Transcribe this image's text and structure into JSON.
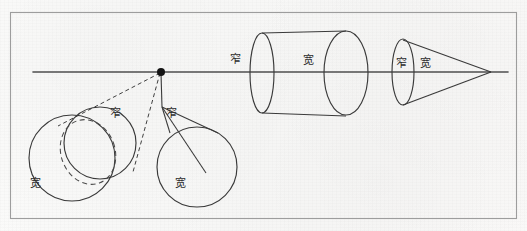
{
  "figure": {
    "page_size": {
      "width": 527,
      "height": 231
    },
    "colors": {
      "paper": "#fafafa",
      "ink": "#3a3a3a",
      "border": "#9a9a9a",
      "horizon": "#555555",
      "vanishing_point": "#111111",
      "label_text": "#2b2b2b"
    },
    "border_frame": {
      "x": 10,
      "y": 12,
      "width": 507,
      "height": 207
    },
    "horizon_line": {
      "x1": 33,
      "y1": 72,
      "x2": 508,
      "y2": 72
    },
    "vanishing_point": {
      "x": 161,
      "y": 72,
      "radius": 4
    }
  },
  "labels": {
    "narrow": "窄",
    "wide": "宽",
    "items": [
      {
        "id": "label-cylinder-far-narrow",
        "text": "窄",
        "x": 230,
        "y": 55,
        "belongs_to": "cylinder-perspective"
      },
      {
        "id": "label-cylinder-near-wide",
        "text": "宽",
        "x": 303,
        "y": 56,
        "belongs_to": "cylinder-perspective"
      },
      {
        "id": "label-cone-base-narrow",
        "text": "窄",
        "x": 396,
        "y": 59,
        "belongs_to": "cone-perspective"
      },
      {
        "id": "label-cone-side-wide",
        "text": "宽",
        "x": 420,
        "y": 59,
        "belongs_to": "cone-perspective"
      },
      {
        "id": "label-left-circles-narrow",
        "text": "窄",
        "x": 110,
        "y": 110,
        "belongs_to": "left-circle-pair"
      },
      {
        "id": "label-left-circles-wide",
        "text": "宽",
        "x": 30,
        "y": 180,
        "belongs_to": "left-circle-pair"
      },
      {
        "id": "label-right-circle-narrow",
        "text": "窄",
        "x": 167,
        "y": 110,
        "belongs_to": "right-cone-circle"
      },
      {
        "id": "label-right-circle-wide",
        "text": "宽",
        "x": 175,
        "y": 180,
        "belongs_to": "right-cone-circle"
      }
    ]
  },
  "shapes": {
    "left_circle_pair": {
      "name": "left-circle-pair",
      "solid_large_circle": {
        "cx": 72,
        "cy": 158,
        "r": 43
      },
      "solid_small_circle": {
        "cx": 100,
        "cy": 143,
        "r": 36
      },
      "dashed_ellipse": {
        "cx": 88,
        "cy": 153,
        "rx": 27,
        "ry": 33,
        "rotation": -22
      },
      "tangent_lines": [
        {
          "x1": 161,
          "y1": 72,
          "x2": 63,
          "y2": 122
        },
        {
          "x1": 161,
          "y1": 72,
          "x2": 132,
          "y2": 170
        }
      ],
      "tangent_style": "dashed"
    },
    "right_cone_circle": {
      "name": "right-cone-circle",
      "circle": {
        "cx": 197,
        "cy": 167,
        "r": 40
      },
      "apex": {
        "x": 161,
        "y": 106
      },
      "side_lines": [
        {
          "x1": 161,
          "y1": 106,
          "x2": 214,
          "y2": 129
        },
        {
          "x1": 161,
          "y1": 106,
          "x2": 168,
          "y2": 132
        }
      ],
      "axis_line": {
        "x1": 161,
        "y1": 106,
        "x2": 205,
        "y2": 172
      },
      "guide_from_vp": {
        "x1": 161,
        "y1": 72,
        "x2": 161,
        "y2": 106
      }
    },
    "cylinder": {
      "name": "cylinder-perspective",
      "far_ellipse": {
        "cx": 262,
        "cy": 73,
        "rx": 12,
        "ry": 40
      },
      "near_ellipse": {
        "cx": 345,
        "cy": 73,
        "rx": 22,
        "ry": 42
      },
      "top_line": {
        "x1": 262,
        "y1": 33,
        "x2": 345,
        "y2": 31
      },
      "bottom_line": {
        "x1": 262,
        "y1": 113,
        "x2": 345,
        "y2": 115
      }
    },
    "cone": {
      "name": "cone-perspective",
      "base_ellipse": {
        "cx": 403,
        "cy": 72,
        "rx": 11,
        "ry": 33
      },
      "apex": {
        "x": 491,
        "y": 72
      },
      "side_lines": [
        {
          "x1": 403,
          "y1": 39,
          "x2": 491,
          "y2": 72
        },
        {
          "x1": 403,
          "y1": 105,
          "x2": 491,
          "y2": 72
        }
      ]
    }
  }
}
